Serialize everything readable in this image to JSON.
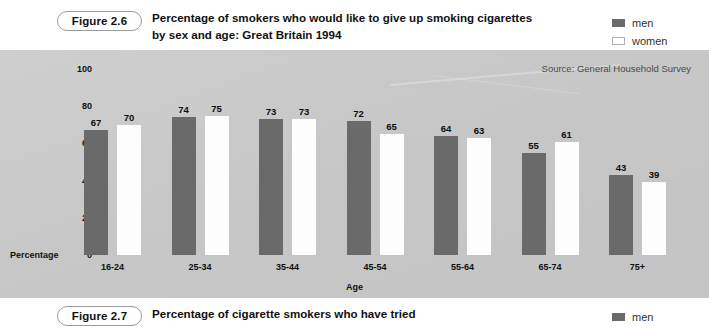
{
  "figure_26": {
    "badge": "Figure 2.6",
    "title_line1": "Percentage of smokers who would like to give up smoking cigarettes",
    "title_line2": "by sex and age: Great Britain 1994",
    "legend": [
      {
        "label": "men",
        "color": "#6a6a6a"
      },
      {
        "label": "women",
        "color": "#ffffff"
      }
    ],
    "source": "Source: General Household Survey"
  },
  "figure_27": {
    "badge": "Figure 2.7",
    "title_line1": "Percentage of cigarette smokers who have tried",
    "legend": [
      {
        "label": "men",
        "color": "#6a6a6a"
      }
    ]
  },
  "chart_data": {
    "type": "bar",
    "title": "Percentage of smokers who would like to give up smoking cigarettes by sex and age: Great Britain 1994",
    "xlabel": "Age",
    "ylabel": "Percentage",
    "ylim": [
      0,
      100
    ],
    "yticks": [
      0,
      20,
      40,
      60,
      80,
      100
    ],
    "grid": false,
    "legend_position": "top-right",
    "annotation": "Source: General Household Survey",
    "categories": [
      "16-24",
      "25-34",
      "35-44",
      "45-54",
      "55-64",
      "65-74",
      "75+"
    ],
    "series": [
      {
        "name": "men",
        "color": "#6a6a6a",
        "values": [
          67,
          74,
          73,
          72,
          64,
          55,
          43
        ]
      },
      {
        "name": "women",
        "color": "#ffffff",
        "values": [
          70,
          75,
          73,
          65,
          63,
          61,
          39
        ]
      }
    ]
  }
}
